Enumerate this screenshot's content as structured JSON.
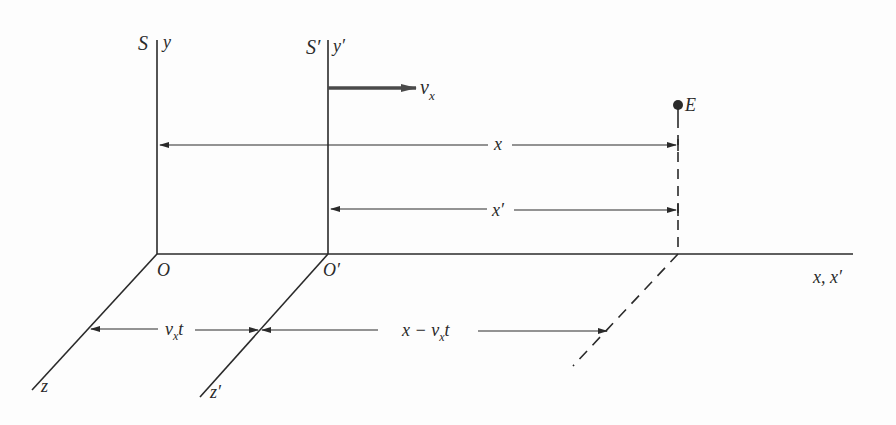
{
  "diagram": {
    "colors": {
      "line": "#2a2a2a",
      "velocity_arrow": "#4a4a4a",
      "background": "#fdfdfd"
    },
    "frames": {
      "S": {
        "frame_label": "S",
        "y_axis_label": "y",
        "origin_label": "O",
        "z_axis_label": "z"
      },
      "S_prime": {
        "frame_label": "S′",
        "y_axis_label": "y′",
        "origin_label": "O′",
        "z_axis_label": "z′"
      }
    },
    "x_axis_label": "x, x′",
    "velocity_label": {
      "main": "v",
      "sub": "x"
    },
    "event_label": "E",
    "dimensions": {
      "x": "x",
      "x_prime": "x′",
      "vxt": {
        "main": "v",
        "sub": "x",
        "tail": "t"
      },
      "x_minus_vxt": {
        "head": "x − v",
        "sub": "x",
        "tail": "t"
      }
    }
  }
}
